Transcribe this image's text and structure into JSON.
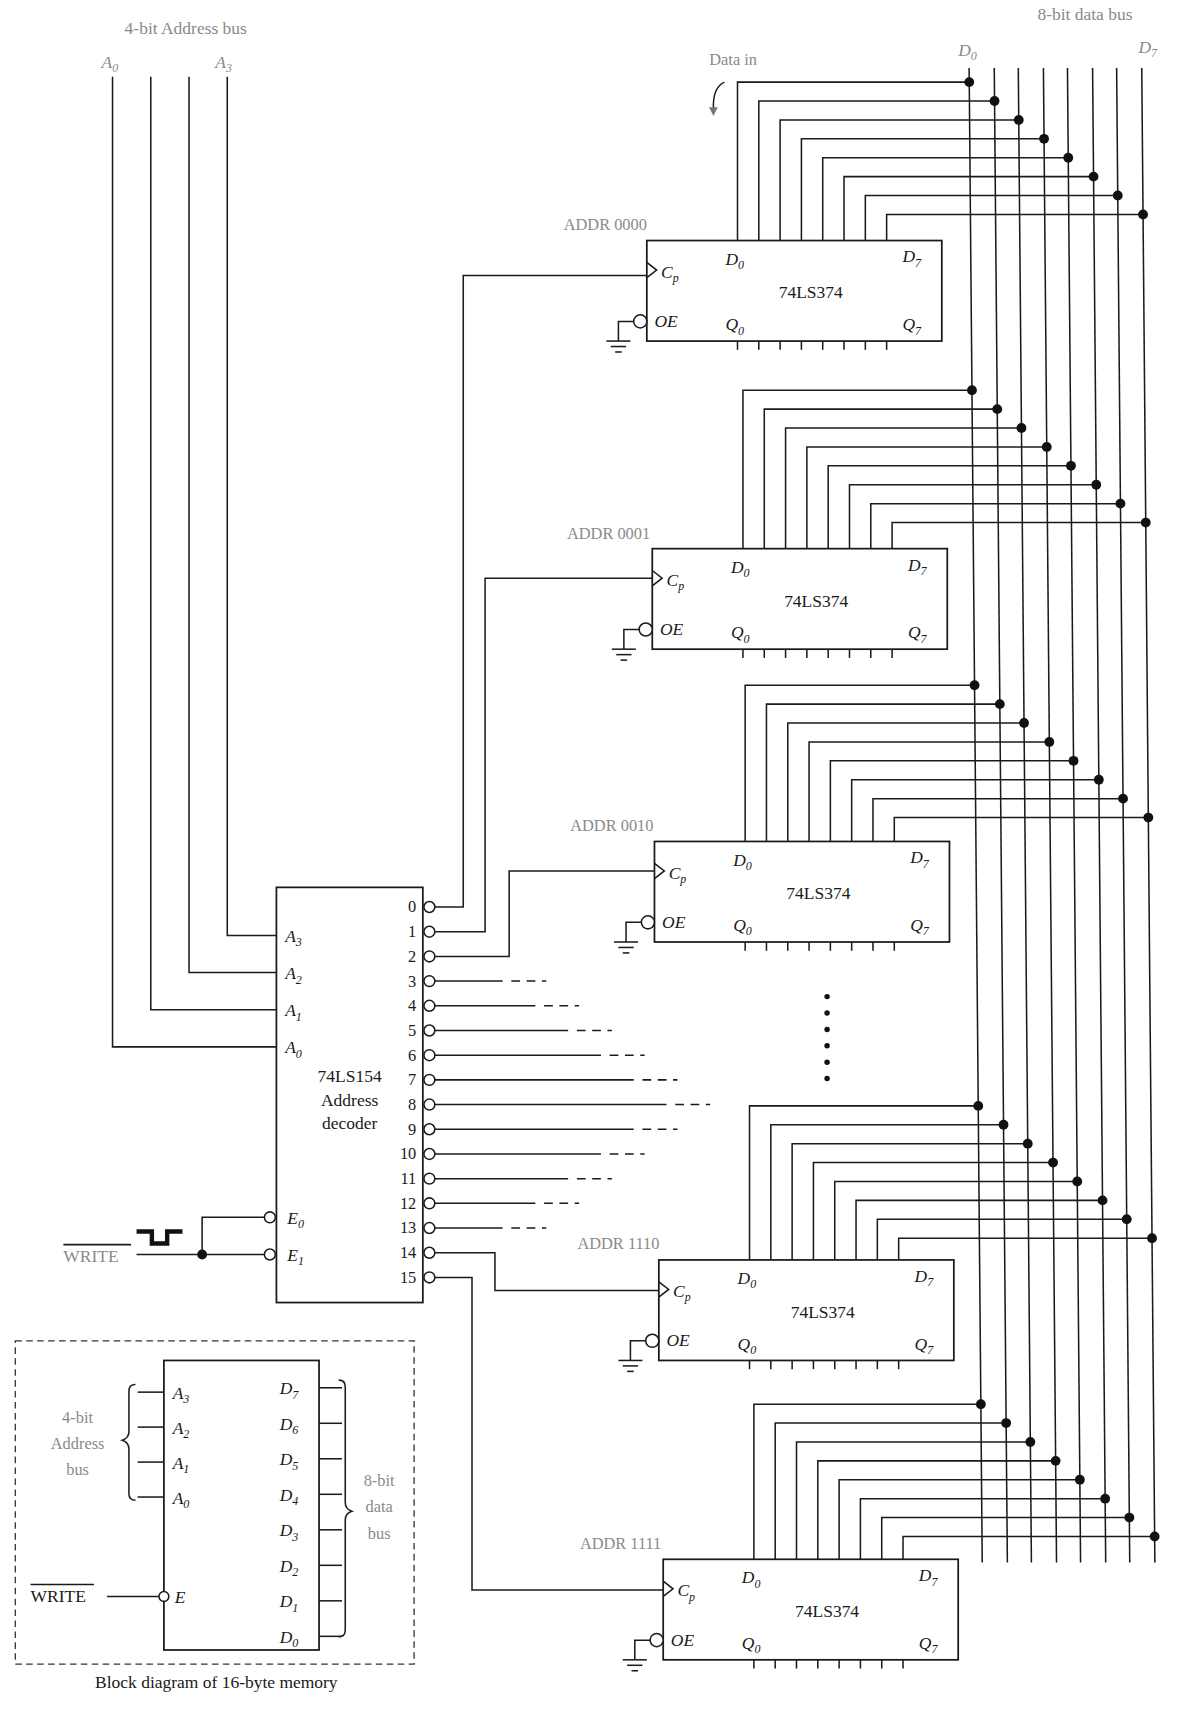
{
  "address_bus": {
    "title": "4-bit Address bus",
    "left_label": "A",
    "left_sub": "0",
    "right_label": "A",
    "right_sub": "3"
  },
  "data_bus": {
    "title": "8-bit data bus",
    "left_label": "D",
    "left_sub": "0",
    "right_label": "D",
    "right_sub": "7",
    "data_in": "Data in"
  },
  "registers": [
    {
      "addr": "ADDR 0000",
      "chip": "74LS374"
    },
    {
      "addr": "ADDR 0001",
      "chip": "74LS374"
    },
    {
      "addr": "ADDR 0010",
      "chip": "74LS374"
    },
    {
      "addr": "ADDR 1110",
      "chip": "74LS374"
    },
    {
      "addr": "ADDR 1111",
      "chip": "74LS374"
    }
  ],
  "pins": {
    "cp": "C",
    "cp_sub": "p",
    "oe": "OE",
    "d": "D",
    "q": "Q",
    "sub0": "0",
    "sub7": "7"
  },
  "decoder": {
    "line1": "74LS154",
    "line2": "Address",
    "line3": "decoder",
    "inputs": [
      {
        "label": "A",
        "sub": "3"
      },
      {
        "label": "A",
        "sub": "2"
      },
      {
        "label": "A",
        "sub": "1"
      },
      {
        "label": "A",
        "sub": "0"
      }
    ],
    "enables": [
      {
        "label": "E",
        "sub": "0"
      },
      {
        "label": "E",
        "sub": "1"
      }
    ],
    "outputs": [
      "0",
      "1",
      "2",
      "3",
      "4",
      "5",
      "6",
      "7",
      "8",
      "9",
      "10",
      "11",
      "12",
      "13",
      "14",
      "15"
    ]
  },
  "write_signal": "WRITE",
  "block": {
    "caption": "Block diagram of 16-byte memory",
    "addr_label": [
      "4-bit",
      "Address",
      "bus"
    ],
    "data_label": [
      "8-bit",
      "data",
      "bus"
    ],
    "addr_pins": [
      {
        "l": "A",
        "s": "3"
      },
      {
        "l": "A",
        "s": "2"
      },
      {
        "l": "A",
        "s": "1"
      },
      {
        "l": "A",
        "s": "0"
      }
    ],
    "data_pins": [
      {
        "l": "D",
        "s": "7"
      },
      {
        "l": "D",
        "s": "6"
      },
      {
        "l": "D",
        "s": "5"
      },
      {
        "l": "D",
        "s": "4"
      },
      {
        "l": "D",
        "s": "3"
      },
      {
        "l": "D",
        "s": "2"
      },
      {
        "l": "D",
        "s": "1"
      },
      {
        "l": "D",
        "s": "0"
      }
    ],
    "enable": "E",
    "write": "WRITE"
  }
}
